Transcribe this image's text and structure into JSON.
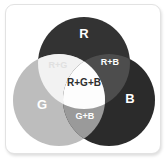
{
  "figure": {
    "kind": "venn-diagram",
    "background_color": "#ffffff",
    "card_border_color": "#e2e2e2"
  },
  "venn": {
    "circles": [
      {
        "id": "r",
        "label": "R",
        "cx": 78,
        "cy": 58,
        "r": 46,
        "fill": "#333333",
        "label_x": 78,
        "label_y": 30,
        "label_color": "#ffffff"
      },
      {
        "id": "g",
        "label": "G",
        "cx": 53,
        "cy": 95,
        "r": 46,
        "fill": "#bdbdbd",
        "label_x": 36,
        "label_y": 101,
        "label_color": "#ffffff"
      },
      {
        "id": "b",
        "label": "B",
        "cx": 103,
        "cy": 95,
        "r": 46,
        "fill": "#2b2b2b",
        "label_x": 124,
        "label_y": 95,
        "label_color": "#ffffff"
      }
    ],
    "overlaps": [
      {
        "id": "rg",
        "label": "R+G",
        "fill": "#f2f2f2",
        "label_x": 52,
        "label_y": 61,
        "label_color": "#e0e0e0"
      },
      {
        "id": "rb",
        "label": "R+B",
        "fill": "#4d4d4d",
        "label_x": 104,
        "label_y": 58,
        "label_color": "#ffffff"
      },
      {
        "id": "gb",
        "label": "G+B",
        "fill": "#9a9a9a",
        "label_x": 79,
        "label_y": 112,
        "label_color": "#ffffff"
      },
      {
        "id": "rgb",
        "label": "R+G+B",
        "fill": "#fdfdfd",
        "label_x": 78,
        "label_y": 78,
        "label_color": "#2e2e2e"
      }
    ]
  }
}
